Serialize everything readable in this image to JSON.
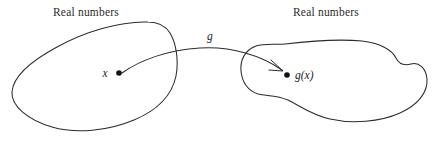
{
  "figure": {
    "type": "function-mapping-diagram",
    "background_color": "#ffffff",
    "stroke_color": "#2b2b2b",
    "dot_color": "#111111",
    "domain_set": {
      "label": "Real numbers",
      "point_label": "x"
    },
    "codomain_set": {
      "label": "Real numbers",
      "point_label": "g(x)"
    },
    "mapping": {
      "function_label": "g"
    }
  }
}
